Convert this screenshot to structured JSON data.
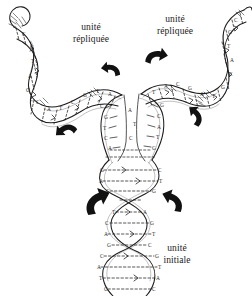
{
  "figure": {
    "type": "scientific-illustration",
    "background_color": "#ffffff",
    "ink_color": "#1a1a1a",
    "width": 252,
    "height": 296
  },
  "labels": {
    "left_unit": {
      "line1": "unité",
      "line2": "répliquée"
    },
    "right_unit": {
      "line1": "unité",
      "line2": "répliquée"
    },
    "initial_unit": {
      "line1": "unité",
      "line2": "initiale"
    }
  },
  "structures": {
    "initial_helix": {
      "name": "unité initiale",
      "orientation": "vertical",
      "description": "double hélice d'ADN parentale"
    },
    "left_arm": {
      "name": "unité répliquée gauche",
      "orientation": "diagonale haut-gauche"
    },
    "right_arm": {
      "name": "unité répliquée droite",
      "orientation": "diagonale haut-droite"
    },
    "fork": {
      "name": "fourche de réplication",
      "description": "zone centrale où les brins se séparent"
    }
  },
  "bases": {
    "alphabet": [
      "A",
      "T",
      "G",
      "C"
    ],
    "initial_helix_rungs": [
      "G",
      "C",
      "A",
      "T",
      "C",
      "G",
      "T",
      "A",
      "C",
      "G",
      "A",
      "T",
      "G",
      "C",
      "T",
      "A"
    ],
    "fork_left_strand": [
      "C",
      "G",
      "T",
      "C",
      "A",
      "G"
    ],
    "fork_right_strand": [
      "G",
      "C",
      "A",
      "T",
      "G",
      "C"
    ],
    "left_arm_rungs": [
      "A",
      "T",
      "G",
      "C",
      "T",
      "A",
      "C",
      "G"
    ],
    "right_arm_rungs": [
      "T",
      "A",
      "C",
      "G",
      "A",
      "T",
      "G",
      "C"
    ]
  },
  "arrows": [
    {
      "id": "arrow-bottom-left",
      "direction": "up-right",
      "x": 96,
      "y": 203
    },
    {
      "id": "arrow-bottom-right",
      "direction": "up-left",
      "x": 172,
      "y": 202
    },
    {
      "id": "arrow-mid-left",
      "direction": "up-left",
      "x": 66,
      "y": 130
    },
    {
      "id": "arrow-mid-right",
      "direction": "up-right",
      "x": 196,
      "y": 117
    },
    {
      "id": "arrow-top-left",
      "direction": "left",
      "x": 110,
      "y": 68
    },
    {
      "id": "arrow-top-right",
      "direction": "right",
      "x": 154,
      "y": 56
    }
  ]
}
